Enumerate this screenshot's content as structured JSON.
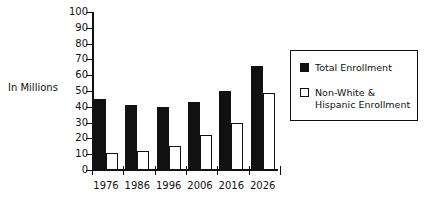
{
  "chart_data": {
    "type": "bar",
    "title": "",
    "xlabel": "",
    "ylabel": "In Millions",
    "ylim": [
      0,
      100
    ],
    "ytick_step": 10,
    "grid": false,
    "legend_position": "right",
    "categories": [
      "1976",
      "1986",
      "1996",
      "2006",
      "2016",
      "2026"
    ],
    "yticks": [
      "100",
      "90",
      "80",
      "70",
      "60",
      "50",
      "40",
      "30",
      "20",
      "10",
      "0"
    ],
    "series": [
      {
        "name": "Total Enrollment",
        "color": "#111111",
        "fill": "solid",
        "values": [
          45,
          41,
          40,
          43,
          50,
          66
        ]
      },
      {
        "name": "Non-White & Hispanic Enrollment",
        "color": "#ffffff",
        "fill": "hollow",
        "values": [
          11,
          12,
          15,
          22,
          30,
          49
        ]
      }
    ]
  },
  "legend": {
    "entries": [
      {
        "label": "Total Enrollment"
      },
      {
        "label": "Non-White & Hispanic Enrollment"
      }
    ]
  }
}
